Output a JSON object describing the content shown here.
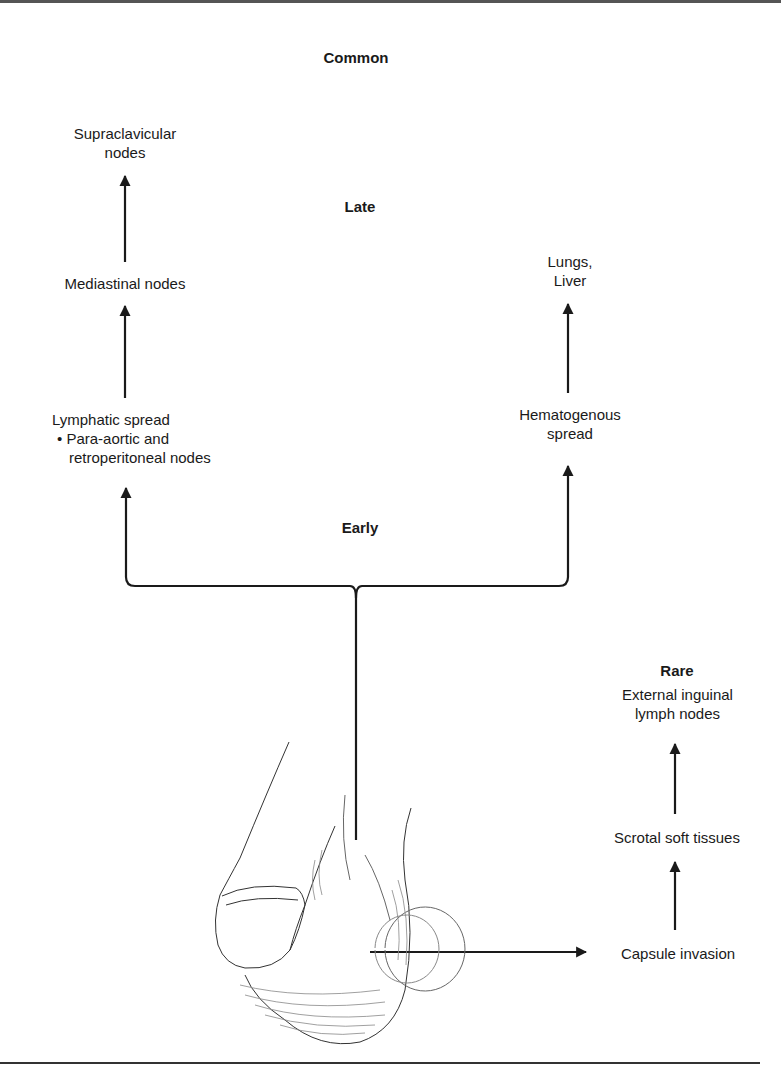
{
  "diagram": {
    "headings": {
      "common": "Common",
      "late": "Late",
      "early": "Early",
      "rare": "Rare"
    },
    "nodes": {
      "supraclavicular": [
        "Supraclavicular",
        "nodes"
      ],
      "mediastinal": "Mediastinal nodes",
      "lymphatic": {
        "title": "Lymphatic spread",
        "bullet": "•",
        "detail_line1": "Para-aortic and",
        "detail_line2": "retroperitoneal nodes"
      },
      "lungs_liver": [
        "Lungs,",
        "Liver"
      ],
      "hematogenous": [
        "Hematogenous",
        "spread"
      ],
      "external_inguinal": [
        "External inguinal",
        "lymph nodes"
      ],
      "scrotal": "Scrotal soft tissues",
      "capsule": "Capsule invasion"
    },
    "illustration": "male-genitalia-line-drawing",
    "colors": {
      "ink": "#1a1a1a",
      "rule": "#333333",
      "background": "#ffffff"
    }
  }
}
